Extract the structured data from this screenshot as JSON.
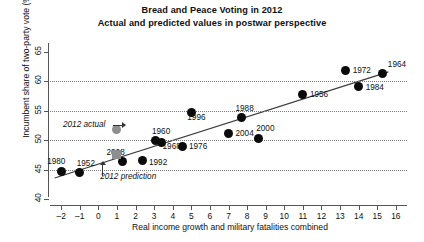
{
  "chart_data": {
    "type": "scatter",
    "title": "Bread and Peace Voting in 2012",
    "subtitle": "Actual and predicted values in postwar perspective",
    "xlabel": "Real income growth and military fatalities combined",
    "ylabel": "Incumbent share of two-party vote (%)",
    "xlim": [
      -2.6,
      16.6
    ],
    "ylim": [
      39.0,
      66.5
    ],
    "xticks": [
      "–2",
      "–1",
      "0",
      "1",
      "2",
      "3",
      "4",
      "5",
      "6",
      "7",
      "8",
      "9",
      "10",
      "11",
      "12",
      "13",
      "14",
      "15",
      "16"
    ],
    "xtick_values": [
      -2,
      -1,
      0,
      1,
      2,
      3,
      4,
      5,
      6,
      7,
      8,
      9,
      10,
      11,
      12,
      13,
      14,
      15,
      16
    ],
    "yticks": [
      "40",
      "45",
      "50",
      "55",
      "60",
      "65"
    ],
    "ytick_values": [
      40,
      45,
      50,
      55,
      60,
      65
    ],
    "grid": "horizontal dotted at 45, 50, 55, 60",
    "gridlines": [
      45,
      50,
      55,
      60
    ],
    "legend": "none",
    "series": [
      {
        "name": "Postwar elections (actual)",
        "marker": "filled black circle",
        "color": "#0b0b0b",
        "points": [
          {
            "label": "1980",
            "x": -2.0,
            "y": 44.7,
            "label_dx": -14,
            "label_dy": -9
          },
          {
            "label": "1952",
            "x": -1.0,
            "y": 44.5,
            "label_dx": -3,
            "label_dy": -9
          },
          {
            "label": "2008",
            "x": 1.3,
            "y": 46.3,
            "label_dx": -16,
            "label_dy": -9
          },
          {
            "label": "1992",
            "x": 2.4,
            "y": 46.5,
            "label_dx": 6,
            "label_dy": 2
          },
          {
            "label": "1960",
            "x": 3.1,
            "y": 49.9,
            "label_dx": -4,
            "label_dy": -9
          },
          {
            "label": "1968",
            "x": 3.4,
            "y": 49.6,
            "label_dx": 1,
            "label_dy": 4
          },
          {
            "label": "1976",
            "x": 4.5,
            "y": 48.9,
            "label_dx": 7,
            "label_dy": 0
          },
          {
            "label": "1996",
            "x": 5.0,
            "y": 54.7,
            "label_dx": -4,
            "label_dy": 5
          },
          {
            "label": "2004",
            "x": 7.0,
            "y": 51.2,
            "label_dx": 7,
            "label_dy": 1
          },
          {
            "label": "1988",
            "x": 7.7,
            "y": 53.9,
            "label_dx": -6,
            "label_dy": -8
          },
          {
            "label": "2000",
            "x": 8.6,
            "y": 50.3,
            "label_dx": -2,
            "label_dy": -9
          },
          {
            "label": "1956",
            "x": 11.0,
            "y": 57.8,
            "label_dx": 7,
            "label_dy": 1
          },
          {
            "label": "1972",
            "x": 13.3,
            "y": 61.8,
            "label_dx": 7,
            "label_dy": 0
          },
          {
            "label": "1984",
            "x": 14.0,
            "y": 59.2,
            "label_dx": 7,
            "label_dy": 2
          },
          {
            "label": "1964",
            "x": 15.3,
            "y": 61.3,
            "label_dx": 5,
            "label_dy": -9
          }
        ]
      },
      {
        "name": "2012 actual",
        "marker": "filled gray circle",
        "color": "#8e8e8e",
        "points": [
          {
            "label": "",
            "x": 0.95,
            "y": 51.9,
            "label_dx": 0,
            "label_dy": 0
          }
        ]
      },
      {
        "name": "2012 prediction",
        "marker": "filled gray square",
        "color": "#8e8e8e",
        "points": [
          {
            "label": "",
            "x": 1.0,
            "y": 47.6,
            "label_dx": 0,
            "label_dy": 0
          }
        ]
      }
    ],
    "fit_line": {
      "name": "2012 prediction (bread and peace model)",
      "x_start": -2.35,
      "y_start": 43.6,
      "x_end": 15.6,
      "y_end": 61.6,
      "color": "#3a3a3a"
    },
    "annotations": [
      {
        "text": "2012 actual",
        "x": -1.9,
        "y": 52.6,
        "style": "italic",
        "arrow": "right"
      },
      {
        "text": "2012 prediction",
        "x": 0.1,
        "y": 43.7,
        "style": "italic",
        "arrow": "up"
      }
    ]
  }
}
